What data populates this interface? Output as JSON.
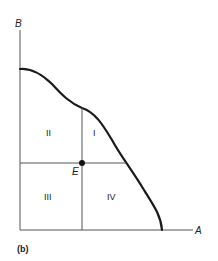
{
  "figure": {
    "panel_label": "(b)",
    "axes": {
      "x_label": "A",
      "y_label": "B"
    },
    "point": {
      "label": "E"
    },
    "regions": [
      "I",
      "II",
      "III",
      "IV"
    ],
    "colors": {
      "line": "#1a1a1a",
      "axis": "#555555",
      "background": "#ffffff"
    }
  }
}
